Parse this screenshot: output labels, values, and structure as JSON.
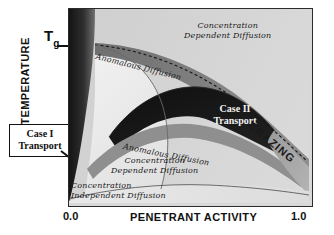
{
  "figure": {
    "type": "schematic-phase-diagram",
    "axes": {
      "y_label": "TEMPERATURE",
      "x_label": "PENETRANT ACTIVITY",
      "x_tick_min": "0.0",
      "x_tick_max": "1.0",
      "y_marker": "T",
      "y_marker_subscript": "g"
    },
    "callout": {
      "line1": "Case I",
      "line2": "Transport"
    },
    "regions": [
      {
        "id": "concentration-dependent-diffusion-top",
        "line1": "Concentration",
        "line2": "Dependent Diffusion"
      },
      {
        "id": "anomalous-diffusion-upper",
        "text": "Anomalous Diffusion"
      },
      {
        "id": "case-ii-transport",
        "line1": "Case II",
        "line2": "Transport"
      },
      {
        "id": "anomalous-diffusion-lower",
        "text": "Anomalous Diffusion"
      },
      {
        "id": "concentration-dependent-diffusion-mid",
        "line1": "Concentration",
        "line2": "Dependent Diffusion"
      },
      {
        "id": "concentration-independent-diffusion",
        "line1": "Concentration",
        "line2": "Independent Diffusion"
      },
      {
        "id": "crazing",
        "text": "CRAZING"
      }
    ],
    "colors": {
      "plot_background": "#d8d8d8",
      "frame": "#2b2b2b",
      "dark_region": "#1a1a1a",
      "mid_dark_region": "#3d3d3d",
      "mid_region": "#8a8a8a",
      "light_region": "#e6e6e6",
      "pale_region": "#f0f0f0",
      "text_dark": "#1a1a1a",
      "text_light": "#f2f2f2"
    }
  }
}
